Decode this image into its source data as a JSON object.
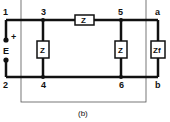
{
  "diagram": {
    "caption": "(b)",
    "nodes": {
      "n1": "1",
      "n2": "2",
      "n3": "3",
      "n4": "4",
      "n5": "5",
      "n6": "6",
      "na": "a",
      "nb": "b"
    },
    "source": {
      "label": "E",
      "polarity": "+"
    },
    "impedances": {
      "series": "Z",
      "shunt_left": "Z",
      "shunt_right": "Z",
      "load": "Zf"
    },
    "colors": {
      "wire": "#111111",
      "box": "#444444",
      "background": "#ffffff"
    }
  }
}
